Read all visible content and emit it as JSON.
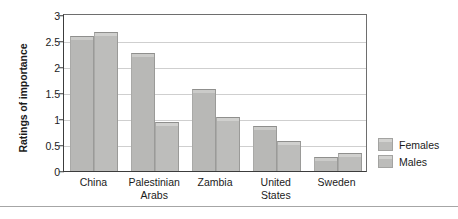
{
  "chart_data": {
    "type": "bar",
    "title": "",
    "xlabel": "",
    "ylabel": "Ratings of importance",
    "ylim": [
      0,
      3
    ],
    "yticks": [
      "0",
      "0.5",
      "1",
      "1.5",
      "2",
      "2.5",
      "3"
    ],
    "ytick_values": [
      0,
      0.5,
      1,
      1.5,
      2,
      2.5,
      3
    ],
    "grid": true,
    "legend_position": "right",
    "categories": [
      "China",
      "Palestinian Arabs",
      "Zambia",
      "United States",
      "Sweden"
    ],
    "category_lines": [
      [
        "China"
      ],
      [
        "Palestinian",
        "Arabs"
      ],
      [
        "Zambia"
      ],
      [
        "United",
        "States"
      ],
      [
        "Sweden"
      ]
    ],
    "series": [
      {
        "name": "Females",
        "color": "#b8b8b6",
        "values": [
          2.6,
          2.27,
          1.58,
          0.86,
          0.27
        ]
      },
      {
        "name": "Males",
        "color": "#bdbdbb",
        "values": [
          2.67,
          0.95,
          1.03,
          0.58,
          0.34
        ]
      }
    ]
  },
  "legend": {
    "items": [
      {
        "label": "Females"
      },
      {
        "label": "Males"
      }
    ]
  },
  "colors": {
    "axis": "#3c3c3c",
    "grid": "#cfcfcf",
    "text": "#1b1b1b",
    "bar_female": "#b8b8b6",
    "bar_male": "#bdbdbb"
  }
}
